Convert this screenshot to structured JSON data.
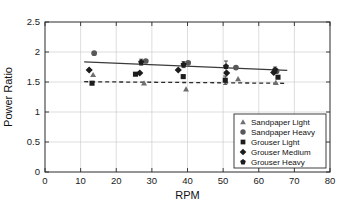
{
  "chart_data": {
    "type": "scatter",
    "title": "",
    "xlabel": "RPM",
    "ylabel": "Power Ratio",
    "xlim": [
      0,
      80
    ],
    "ylim": [
      0,
      2.5
    ],
    "xticks": [
      0,
      10,
      20,
      30,
      40,
      50,
      60,
      70,
      80
    ],
    "yticks": [
      0,
      0.5,
      1,
      1.5,
      2,
      2.5
    ],
    "xtick_labels": [
      "0",
      "10",
      "20",
      "30",
      "40",
      "50",
      "60",
      "70",
      "80"
    ],
    "ytick_labels": [
      "0",
      "0.5",
      "1",
      "1.5",
      "2",
      "2.5"
    ],
    "grid": true,
    "legend_position": "lower right",
    "series": [
      {
        "name": "Sandpaper Light",
        "marker": "triangle",
        "color": "#6f6f6f",
        "points": [
          {
            "x": 13.5,
            "y": 1.62
          },
          {
            "x": 27.8,
            "y": 1.48
          },
          {
            "x": 39.6,
            "y": 1.38
          },
          {
            "x": 54.2,
            "y": 1.55
          },
          {
            "x": 64.8,
            "y": 1.49
          }
        ]
      },
      {
        "name": "Sandpaper Heavy",
        "marker": "circle",
        "color": "#585858",
        "points": [
          {
            "x": 13.8,
            "y": 1.98
          },
          {
            "x": 28.3,
            "y": 1.85
          },
          {
            "x": 40.2,
            "y": 1.82
          },
          {
            "x": 53.6,
            "y": 1.74
          },
          {
            "x": 65.0,
            "y": 1.68
          }
        ]
      },
      {
        "name": "Grouser Light",
        "marker": "square",
        "color": "#1d1d1d",
        "points": [
          {
            "x": 13.2,
            "y": 1.48
          },
          {
            "x": 25.4,
            "y": 1.63
          },
          {
            "x": 38.8,
            "y": 1.59
          },
          {
            "x": 50.6,
            "y": 1.53
          },
          {
            "x": 65.4,
            "y": 1.58
          }
        ]
      },
      {
        "name": "Grouser Medium",
        "marker": "diamond",
        "color": "#1d1d1d",
        "points": [
          {
            "x": 12.4,
            "y": 1.7
          },
          {
            "x": 26.6,
            "y": 1.65
          },
          {
            "x": 37.4,
            "y": 1.7
          },
          {
            "x": 51.0,
            "y": 1.65
          },
          {
            "x": 64.2,
            "y": 1.66
          }
        ]
      },
      {
        "name": "Grouser Heavy",
        "marker": "pentagon",
        "color": "#1d1d1d",
        "points": [
          {
            "x": 27.0,
            "y": 1.83
          },
          {
            "x": 38.9,
            "y": 1.79
          },
          {
            "x": 50.8,
            "y": 1.76
          },
          {
            "x": 64.6,
            "y": 1.7
          }
        ]
      }
    ],
    "error_bars": [
      {
        "x": 27.0,
        "y": 1.83,
        "err": 0.05
      },
      {
        "x": 38.9,
        "y": 1.79,
        "err": 0.05
      },
      {
        "x": 50.8,
        "y": 1.76,
        "err": 0.09
      },
      {
        "x": 50.6,
        "y": 1.53,
        "err": 0.07
      },
      {
        "x": 64.6,
        "y": 1.7,
        "err": 0.05
      }
    ],
    "trend_lines": [
      {
        "name": "upper-trend",
        "style": "solid",
        "x0": 11.0,
        "y0": 1.835,
        "x1": 68.0,
        "y1": 1.695
      },
      {
        "name": "lower-trend",
        "style": "dashed",
        "x0": 11.0,
        "y0": 1.505,
        "x1": 68.0,
        "y1": 1.478
      }
    ],
    "legend": [
      {
        "label": "Sandpaper Light",
        "marker": "triangle",
        "color": "#6f6f6f"
      },
      {
        "label": "Sandpaper Heavy",
        "marker": "circle",
        "color": "#585858"
      },
      {
        "label": "Grouser Light",
        "marker": "square",
        "color": "#1d1d1d"
      },
      {
        "label": "Grouser Medium",
        "marker": "diamond",
        "color": "#1d1d1d"
      },
      {
        "label": "Grouser Heavy",
        "marker": "pentagon",
        "color": "#1d1d1d"
      }
    ]
  }
}
